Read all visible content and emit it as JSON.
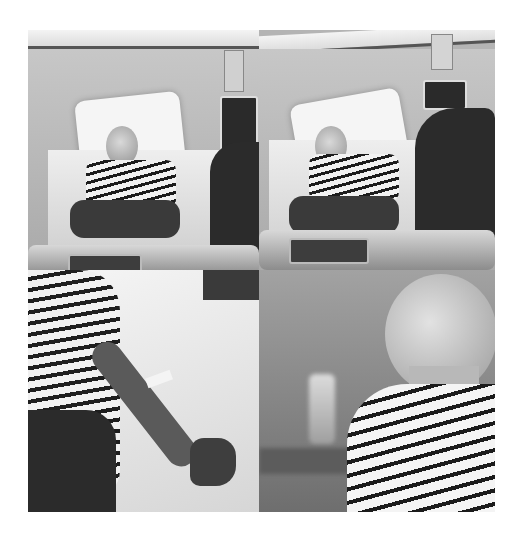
{
  "collage": {
    "layout": "2x2 grid",
    "style": "black-and-white photography",
    "background_color": "#ffffff",
    "panels": [
      {
        "position": "top-left",
        "description": "Patient in striped top lying in hospital bed, visitor seated at right"
      },
      {
        "position": "top-right",
        "description": "Patient in bed with hand near mouth, visitor with dark hair in foreground"
      },
      {
        "position": "bottom-left",
        "description": "Close-up of arm with IV cannula resting on white bed sheet"
      },
      {
        "position": "bottom-right",
        "description": "Profile of bald woman in striped top, blurred bottle in background"
      }
    ]
  }
}
